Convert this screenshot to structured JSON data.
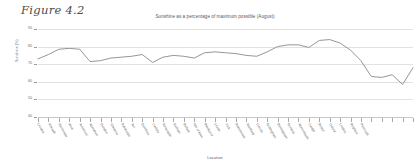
{
  "figure": {
    "caption": "Figure 4.2"
  },
  "chart_data": {
    "type": "line",
    "title": "Sunshine as a percentage of maximum possible (August)",
    "xlabel": "Location",
    "ylabel": "Sunshine (%)",
    "ylim": [
      40,
      90
    ],
    "yticks": [
      90,
      80,
      70,
      60,
      50,
      40
    ],
    "grid": true,
    "legend": "none",
    "line_color": "#8a8a8c",
    "categories": [
      "Lerwick",
      "Kirkwall",
      "Stornoway",
      "Wick",
      "Aviemore",
      "Aberdeen",
      "Dundee",
      "Glasgow",
      "Edinburgh",
      "Ayr",
      "Dumfries",
      "Carlisle",
      "Newcastle",
      "Durham",
      "Belfast",
      "Isle of Man",
      "Blackpool",
      "Leeds",
      "York",
      "Manchester",
      "Sheffield",
      "Lincoln",
      "Nottingham",
      "Birmingham",
      "Norwich",
      "Aberystwyth",
      "Cardiff",
      "Bristol",
      "Oxford",
      "London",
      "Brighton",
      "Plymouth"
    ],
    "values": [
      73.0,
      75.5,
      78.5,
      79.0,
      78.5,
      71.5,
      72.0,
      73.5,
      74.0,
      74.5,
      75.5,
      71.0,
      74.0,
      75.0,
      74.5,
      73.5,
      76.5,
      77.0,
      76.5,
      76.0,
      75.0,
      74.5,
      77.0,
      80.0,
      81.0,
      81.0,
      79.5,
      83.5,
      84.0,
      82.0,
      78.0,
      72.0
    ],
    "values_tail": [
      63.0,
      62.5,
      64.0,
      58.5,
      68.0
    ]
  }
}
